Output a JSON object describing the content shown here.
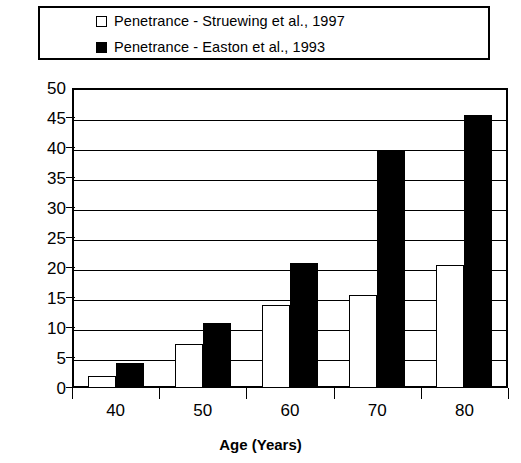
{
  "legend": {
    "items": [
      {
        "label": "Penetrance - Struewing et al., 1997",
        "swatch": "hollow-square-icon",
        "color": "#ffffff"
      },
      {
        "label": "Penetrance - Easton et al., 1993",
        "swatch": "filled-square-icon",
        "color": "#000000"
      }
    ]
  },
  "axes": {
    "x_title": "Age (Years)",
    "y_title": "",
    "y_ticks": [
      "0",
      "5",
      "10",
      "15",
      "20",
      "25",
      "30",
      "35",
      "40",
      "45",
      "50"
    ],
    "x_ticks": [
      "40",
      "50",
      "60",
      "70",
      "80"
    ]
  },
  "chart_data": {
    "type": "bar",
    "title": "",
    "subtitle": "",
    "xlabel": "Age (Years)",
    "ylabel": "",
    "categories": [
      "40",
      "50",
      "60",
      "70",
      "80"
    ],
    "series": [
      {
        "name": "Penetrance - Struewing et al., 1997",
        "color": "#ffffff",
        "edge_color": "#000000",
        "values": [
          2.0,
          7.3,
          13.8,
          15.5,
          20.5
        ]
      },
      {
        "name": "Penetrance - Easton et al., 1993",
        "color": "#000000",
        "edge_color": "#000000",
        "values": [
          4.1,
          10.8,
          20.8,
          39.6,
          45.5
        ]
      }
    ],
    "ylim": [
      0,
      50
    ],
    "ytick_step": 5,
    "grid": true,
    "grid_axis": "y",
    "legend_position": "top",
    "bar_style": "grouped"
  }
}
